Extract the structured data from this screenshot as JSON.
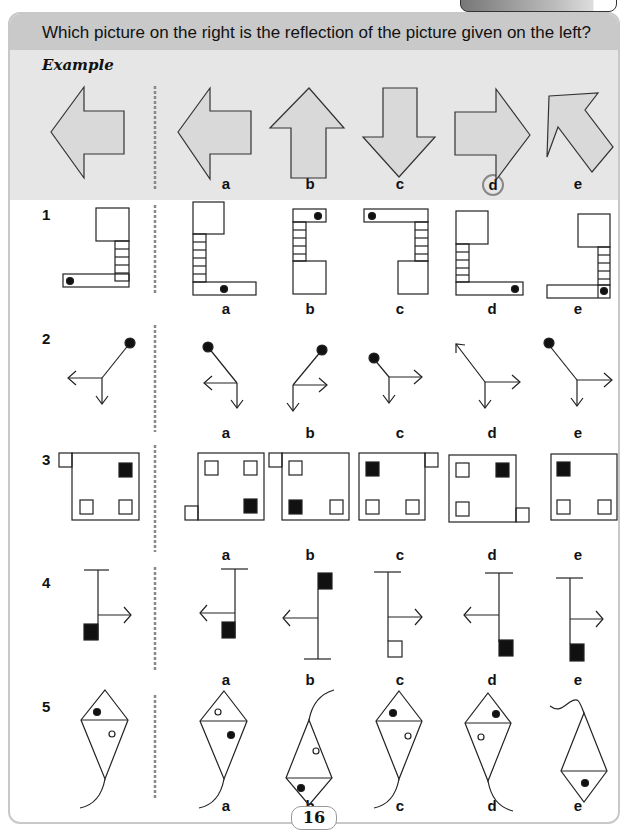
{
  "header": {
    "question": "Which picture on the right is the reflection of the picture given on the left?"
  },
  "example": {
    "label": "Example",
    "options": [
      "a",
      "b",
      "c",
      "d",
      "e"
    ],
    "answer": "d"
  },
  "questions": [
    {
      "number": "1",
      "options": [
        "a",
        "b",
        "c",
        "d",
        "e"
      ]
    },
    {
      "number": "2",
      "options": [
        "a",
        "b",
        "c",
        "d",
        "e"
      ]
    },
    {
      "number": "3",
      "options": [
        "a",
        "b",
        "c",
        "d",
        "e"
      ]
    },
    {
      "number": "4",
      "options": [
        "a",
        "b",
        "c",
        "d",
        "e"
      ]
    },
    {
      "number": "5",
      "options": [
        "a",
        "b",
        "c",
        "d",
        "e"
      ]
    }
  ],
  "page_number": "16",
  "colors": {
    "header_bg": "#c9c9c9",
    "example_bg": "#e6e6e6",
    "arrow_fill": "#d9d9d9",
    "divider": "#888888",
    "ink": "#111111"
  }
}
